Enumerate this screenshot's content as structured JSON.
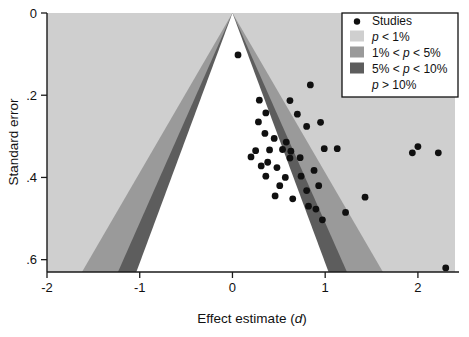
{
  "chart_data": {
    "type": "scatter",
    "title": "",
    "xlabel": "Effect estimate (d)",
    "xlabel_plain": "Effect estimate (",
    "xlabel_italic": "d",
    "xlabel_close": ")",
    "ylabel": "Standard error",
    "xlim": [
      -2.0,
      2.4
    ],
    "ylim": [
      0.0,
      0.63
    ],
    "y_inverted": true,
    "grid": false,
    "xticks": [
      -2,
      -1,
      0,
      1,
      2
    ],
    "xtick_labels": [
      "-2",
      "-1",
      "0",
      "1",
      "2"
    ],
    "yticks": [
      0,
      0.2,
      0.4,
      0.6
    ],
    "ytick_labels": [
      "0",
      ".2",
      ".4",
      ".6"
    ],
    "apex": {
      "x": 0.0,
      "y": 0.0
    },
    "contour_bands": [
      {
        "name": "p > 10%",
        "slope_z": 1.645,
        "color": "#ffffff"
      },
      {
        "name": "5% < p < 10%",
        "slope_z": 1.96,
        "color": "#5d5d5d"
      },
      {
        "name": "1% < p < 5%",
        "slope_z": 2.576,
        "color": "#9a9a9a"
      },
      {
        "name": "p < 1%",
        "slope_z": 99,
        "color": "#cfcfcf"
      }
    ],
    "background_color": "#cfcfcf",
    "point_color": "#101010",
    "point_radius": 3.4,
    "series": [
      {
        "name": "Studies",
        "points": [
          [
            0.06,
            0.102
          ],
          [
            0.62,
            0.213
          ],
          [
            0.84,
            0.175
          ],
          [
            0.29,
            0.212
          ],
          [
            0.36,
            0.243
          ],
          [
            0.7,
            0.246
          ],
          [
            0.28,
            0.265
          ],
          [
            0.8,
            0.276
          ],
          [
            0.95,
            0.266
          ],
          [
            0.35,
            0.293
          ],
          [
            0.58,
            0.314
          ],
          [
            0.45,
            0.305
          ],
          [
            0.25,
            0.335
          ],
          [
            0.4,
            0.333
          ],
          [
            0.54,
            0.332
          ],
          [
            0.63,
            0.336
          ],
          [
            0.99,
            0.33
          ],
          [
            1.13,
            0.33
          ],
          [
            2.0,
            0.325
          ],
          [
            0.2,
            0.35
          ],
          [
            0.62,
            0.353
          ],
          [
            0.73,
            0.352
          ],
          [
            2.22,
            0.34
          ],
          [
            1.94,
            0.34
          ],
          [
            0.38,
            0.363
          ],
          [
            0.31,
            0.372
          ],
          [
            0.48,
            0.376
          ],
          [
            0.88,
            0.383
          ],
          [
            0.36,
            0.397
          ],
          [
            0.57,
            0.4
          ],
          [
            0.74,
            0.397
          ],
          [
            0.51,
            0.42
          ],
          [
            0.93,
            0.42
          ],
          [
            0.8,
            0.432
          ],
          [
            0.46,
            0.445
          ],
          [
            0.65,
            0.452
          ],
          [
            1.43,
            0.448
          ],
          [
            0.82,
            0.47
          ],
          [
            0.9,
            0.477
          ],
          [
            1.22,
            0.485
          ],
          [
            0.97,
            0.503
          ],
          [
            2.3,
            0.62
          ]
        ]
      }
    ],
    "legend": {
      "position": "top-right",
      "border_color": "#111111",
      "background": "#ffffff",
      "entries": [
        {
          "label": "Studies",
          "marker": "dot",
          "color": "#101010"
        },
        {
          "label": "p < 1%",
          "marker": "swatch",
          "color": "#cfcfcf",
          "italic_lead": "p",
          "rest": " < 1%"
        },
        {
          "label": "1% < p < 5%",
          "marker": "swatch",
          "color": "#9a9a9a",
          "lead": "1% < ",
          "italic_lead": "p",
          "rest": " < 5%"
        },
        {
          "label": "5% < p < 10%",
          "marker": "swatch",
          "color": "#5d5d5d",
          "lead": "5% < ",
          "italic_lead": "p",
          "rest": " < 10%"
        },
        {
          "label": "p > 10%",
          "marker": "none",
          "color": "#ffffff",
          "italic_lead": "p",
          "rest": " > 10%"
        }
      ]
    }
  }
}
